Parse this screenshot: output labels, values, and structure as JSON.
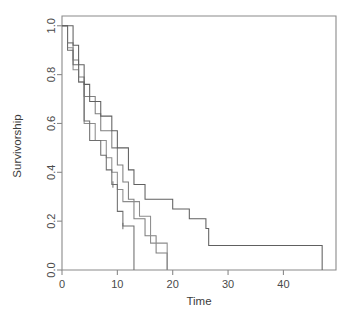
{
  "chart_data": {
    "type": "line",
    "subtype": "kaplan-meier-step",
    "title": "",
    "xlabel": "Time",
    "ylabel": "Survivorship",
    "xlim": [
      0,
      49.5
    ],
    "ylim": [
      0.0,
      1.04
    ],
    "xticks": [
      0,
      10,
      20,
      30,
      40
    ],
    "xtick_labels": [
      "0",
      "10",
      "20",
      "30",
      "40"
    ],
    "yticks": [
      0.0,
      0.2,
      0.4,
      0.6,
      0.8,
      1.0
    ],
    "ytick_labels": [
      "0.0",
      "0.2",
      "0.4",
      "0.6",
      "0.8",
      "1.0"
    ],
    "grid": false,
    "legend": "none",
    "box": "open-frame",
    "series": [
      {
        "name": "curve-1",
        "color": "#7f7f7f",
        "drop_to_zero": true,
        "censor_marks": [],
        "steps": [
          [
            0,
            1.0
          ],
          [
            1,
            0.93
          ],
          [
            2,
            0.86
          ],
          [
            3,
            0.79
          ],
          [
            4,
            0.71
          ],
          [
            5,
            0.71
          ],
          [
            6,
            0.64
          ],
          [
            7,
            0.57
          ],
          [
            8,
            0.57
          ],
          [
            9,
            0.5
          ],
          [
            10,
            0.43
          ],
          [
            11,
            0.36
          ],
          [
            12,
            0.29
          ],
          [
            13,
            0.21
          ],
          [
            14,
            0.21
          ],
          [
            15,
            0.14
          ],
          [
            16,
            0.14
          ],
          [
            17,
            0.07
          ],
          [
            19,
            0.05
          ]
        ]
      },
      {
        "name": "curve-2",
        "color": "#8c8c8c",
        "drop_to_zero": true,
        "censor_marks": [],
        "steps": [
          [
            0,
            1.0
          ],
          [
            1,
            0.91
          ],
          [
            2,
            0.82
          ],
          [
            3,
            0.77
          ],
          [
            4,
            0.6
          ],
          [
            5,
            0.6
          ],
          [
            6,
            0.53
          ],
          [
            7,
            0.53
          ],
          [
            8,
            0.46
          ],
          [
            9,
            0.4
          ],
          [
            10,
            0.33
          ],
          [
            11,
            0.28
          ],
          [
            12,
            0.28
          ],
          [
            13,
            0.28
          ],
          [
            14,
            0.22
          ],
          [
            15,
            0.22
          ],
          [
            16,
            0.11
          ],
          [
            18,
            0.11
          ],
          [
            19,
            0.0
          ]
        ]
      },
      {
        "name": "curve-3",
        "color": "#6e6e6e",
        "drop_to_zero": true,
        "censor_marks": [
          9.2,
          11.0
        ],
        "steps": [
          [
            0,
            1.0
          ],
          [
            1,
            0.9
          ],
          [
            2,
            0.84
          ],
          [
            3,
            0.77
          ],
          [
            4,
            0.61
          ],
          [
            5,
            0.53
          ],
          [
            6,
            0.53
          ],
          [
            7,
            0.47
          ],
          [
            8,
            0.41
          ],
          [
            9,
            0.35
          ],
          [
            10,
            0.24
          ],
          [
            11,
            0.18
          ],
          [
            12,
            0.18
          ],
          [
            13,
            0.0
          ]
        ]
      },
      {
        "name": "curve-4",
        "color": "#606060",
        "drop_to_zero": true,
        "censor_marks": [],
        "steps": [
          [
            0,
            1.0
          ],
          [
            1,
            1.0
          ],
          [
            2,
            0.92
          ],
          [
            3,
            0.84
          ],
          [
            4,
            0.76
          ],
          [
            5,
            0.69
          ],
          [
            6,
            0.69
          ],
          [
            7,
            0.63
          ],
          [
            8,
            0.63
          ],
          [
            9,
            0.57
          ],
          [
            10,
            0.5
          ],
          [
            11,
            0.5
          ],
          [
            12,
            0.41
          ],
          [
            13,
            0.35
          ],
          [
            14,
            0.35
          ],
          [
            15,
            0.29
          ],
          [
            16,
            0.29
          ],
          [
            17,
            0.29
          ],
          [
            18,
            0.29
          ],
          [
            19,
            0.29
          ],
          [
            20,
            0.25
          ],
          [
            21,
            0.25
          ],
          [
            22,
            0.25
          ],
          [
            23,
            0.21
          ],
          [
            24,
            0.21
          ],
          [
            25,
            0.21
          ],
          [
            26,
            0.17
          ],
          [
            26.5,
            0.1
          ],
          [
            47,
            0.1
          ]
        ]
      }
    ]
  },
  "axes": {
    "x_title": "Time",
    "y_title": "Survivorship"
  },
  "style": {
    "background": "#ffffff",
    "axis_color": "#8a8a8a",
    "tick_text_color": "#4a4a4a"
  }
}
